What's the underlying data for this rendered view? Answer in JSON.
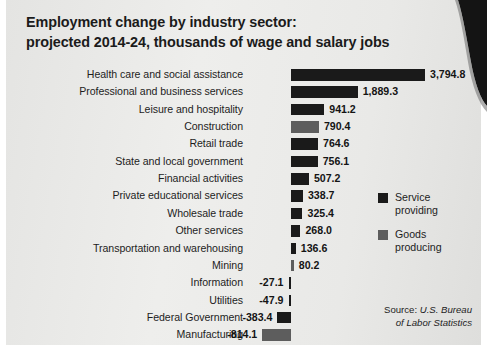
{
  "chart_data": {
    "type": "bar",
    "orientation": "horizontal",
    "title": "Employment change by industry sector: projected 2014-24, thousands of wage and salary jobs",
    "title_lines": [
      "Employment change by industry sector:",
      "projected 2014-24, thousands of wage and salary jobs"
    ],
    "xlabel": "",
    "ylabel": "",
    "xlim": [
      -814.1,
      3794.8
    ],
    "grid": false,
    "legend_position": "right",
    "categories": [
      "Health care and social assistance",
      "Professional and business services",
      "Leisure and hospitality",
      "Construction",
      "Retail trade",
      "State and local government",
      "Financial activities",
      "Private educational services",
      "Wholesale trade",
      "Other services",
      "Transportation and warehousing",
      "Mining",
      "Information",
      "Utilities",
      "Federal Government",
      "Manufacturing"
    ],
    "values": [
      3794.8,
      1889.3,
      941.2,
      790.4,
      764.6,
      756.1,
      507.2,
      338.7,
      325.4,
      268.0,
      136.6,
      80.2,
      -27.1,
      -47.9,
      -383.4,
      -814.1
    ],
    "value_labels": [
      "3,794.8",
      "1,889.3",
      "941.2",
      "790.4",
      "764.6",
      "756.1",
      "507.2",
      "338.7",
      "325.4",
      "268.0",
      "136.6",
      "80.2",
      "-27.1",
      "-47.9",
      "-383.4",
      "-814.1"
    ],
    "groups": [
      "service",
      "service",
      "service",
      "goods",
      "service",
      "service",
      "service",
      "service",
      "service",
      "service",
      "service",
      "goods",
      "service",
      "service",
      "service",
      "goods"
    ],
    "series": [
      {
        "name": "Service providing",
        "color": "#1a1a1a"
      },
      {
        "name": "Goods producing",
        "color": "#5d5d5d"
      }
    ],
    "annotations": [
      "Source: U.S. Bureau of Labor Statistics"
    ]
  },
  "legend": {
    "items": [
      {
        "label_lines": [
          "Service",
          "providing"
        ],
        "group": "service",
        "color": "#1a1a1a"
      },
      {
        "label_lines": [
          "Goods",
          "producing"
        ],
        "group": "goods",
        "color": "#5d5d5d"
      }
    ]
  },
  "source": {
    "prefix": "Source:",
    "line1": "U.S. Bureau",
    "line2": "of Labor Statistics"
  },
  "colors": {
    "service": "#1a1a1a",
    "goods": "#5d5d5d",
    "paper": "#e8e8e6",
    "text": "#1d1d1d"
  }
}
